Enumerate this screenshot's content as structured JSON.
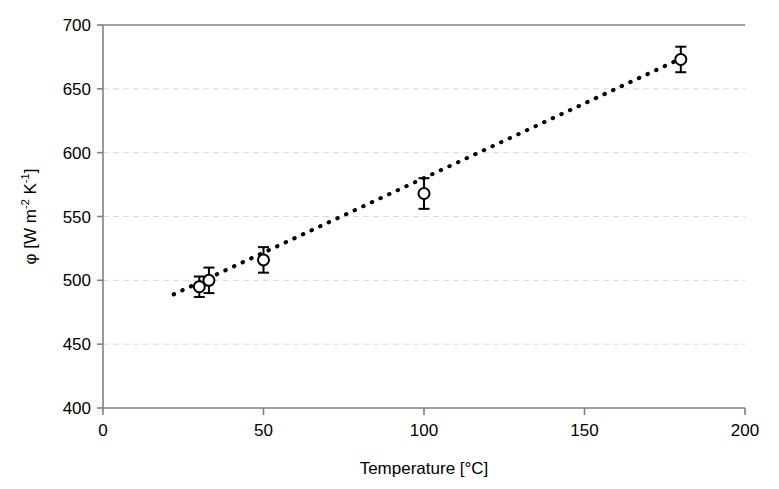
{
  "chart_data": {
    "type": "scatter",
    "title": "",
    "subtitle": "",
    "xlabel": "Temperature [°C]",
    "ylabel": "φ [W m⁻² K⁻¹]",
    "ylabel_parts": {
      "phi": "φ",
      "bracket_open": " [W m",
      "exp_minus_two": "-2",
      "kelvin": " K",
      "exp_minus_one": "-1",
      "bracket_close": "]"
    },
    "xlim": [
      0,
      200
    ],
    "ylim": [
      400,
      700
    ],
    "xticks": [
      0,
      50,
      100,
      150,
      200
    ],
    "yticks": [
      400,
      450,
      500,
      550,
      600,
      650,
      700
    ],
    "xtick_labels": [
      "0",
      "50",
      "100",
      "150",
      "200"
    ],
    "ytick_labels": [
      "400",
      "450",
      "500",
      "550",
      "600",
      "650",
      "700"
    ],
    "grid": {
      "horizontal": true,
      "vertical": false,
      "style": "dashed",
      "color": "#d9d9d9"
    },
    "legend": {
      "visible": false,
      "position": "none",
      "entries": []
    },
    "marker": {
      "shape": "open-circle",
      "size": 11,
      "edge_color": "#000000",
      "fill_color": "#ffffff",
      "edge_width": 2
    },
    "errorbar": {
      "color": "#000000",
      "width": 2,
      "cap_width": 11
    },
    "trendline": {
      "style": "dotted",
      "color": "#000000",
      "width": 4,
      "x_start": 22,
      "y_start": 489,
      "x_end": 182,
      "y_end": 676
    },
    "axis_color": "#808080",
    "series": [
      {
        "name": "phi",
        "x": [
          30,
          33,
          50,
          100,
          180
        ],
        "y": [
          495,
          500,
          516,
          568,
          673
        ],
        "yerr": [
          8,
          10,
          10,
          12,
          10
        ]
      }
    ],
    "points": [
      {
        "x": 30,
        "y": 495,
        "yerr": 8
      },
      {
        "x": 33,
        "y": 500,
        "yerr": 10
      },
      {
        "x": 50,
        "y": 516,
        "yerr": 10
      },
      {
        "x": 100,
        "y": 568,
        "yerr": 12
      },
      {
        "x": 180,
        "y": 673,
        "yerr": 10
      }
    ]
  }
}
